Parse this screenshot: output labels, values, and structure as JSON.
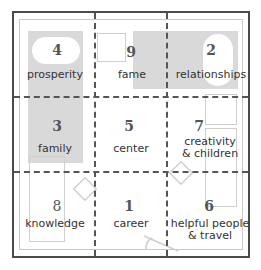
{
  "colors": {
    "border": "#4a4a4a",
    "inner_border": "#c8c8c8",
    "shade": "#d9d9d9",
    "dash": "#555555"
  },
  "cells": [
    {
      "number": "4",
      "label": "prosperity"
    },
    {
      "number": "9",
      "label": "fame"
    },
    {
      "number": "2",
      "label": "relationships"
    },
    {
      "number": "3",
      "label": "family"
    },
    {
      "number": "5",
      "label": "center"
    },
    {
      "number": "7",
      "label_line1": "creativity",
      "label_line2": "& children"
    },
    {
      "number": "8",
      "label": "knowledge"
    },
    {
      "number": "1",
      "label": "career"
    },
    {
      "number": "6",
      "label_line1": "helpful people",
      "label_line2": "& travel"
    }
  ]
}
